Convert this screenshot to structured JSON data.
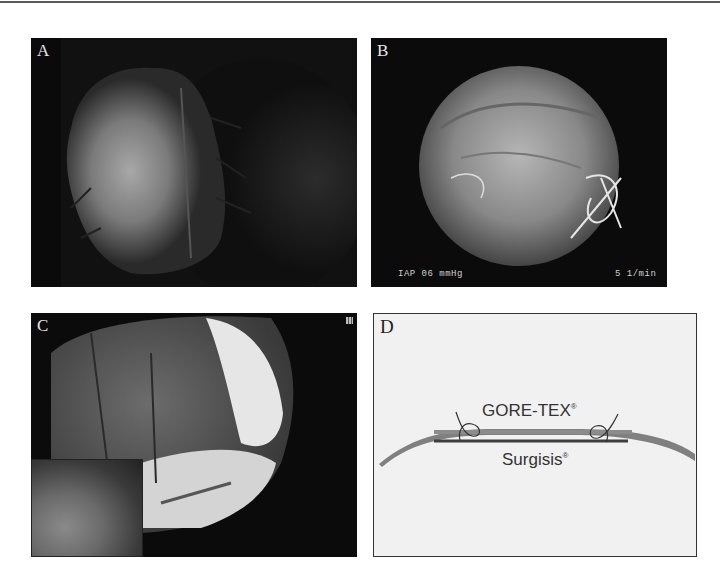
{
  "figure": {
    "panels": [
      {
        "id": "A",
        "label": "A",
        "description": "Laparoscopic/operative view of sutured tissue patch"
      },
      {
        "id": "B",
        "label": "B",
        "description": "Endoscopic circular view with sutures",
        "overlay_left": "IAP 06 mmHg",
        "overlay_right": "5 1/min"
      },
      {
        "id": "C",
        "label": "C",
        "description": "Endoscopic view with mesh and inset"
      },
      {
        "id": "D",
        "label": "D",
        "description": "Schematic of mesh layering",
        "diagram": {
          "top_layer": "GORE-TEX",
          "bottom_layer": "Surgisis",
          "mark": "®"
        }
      }
    ]
  },
  "colors": {
    "panel_bg": "#0c0c0c",
    "diagram_bg": "#f1f1f1",
    "curve": "#7a7a7a",
    "text": "#333333"
  }
}
